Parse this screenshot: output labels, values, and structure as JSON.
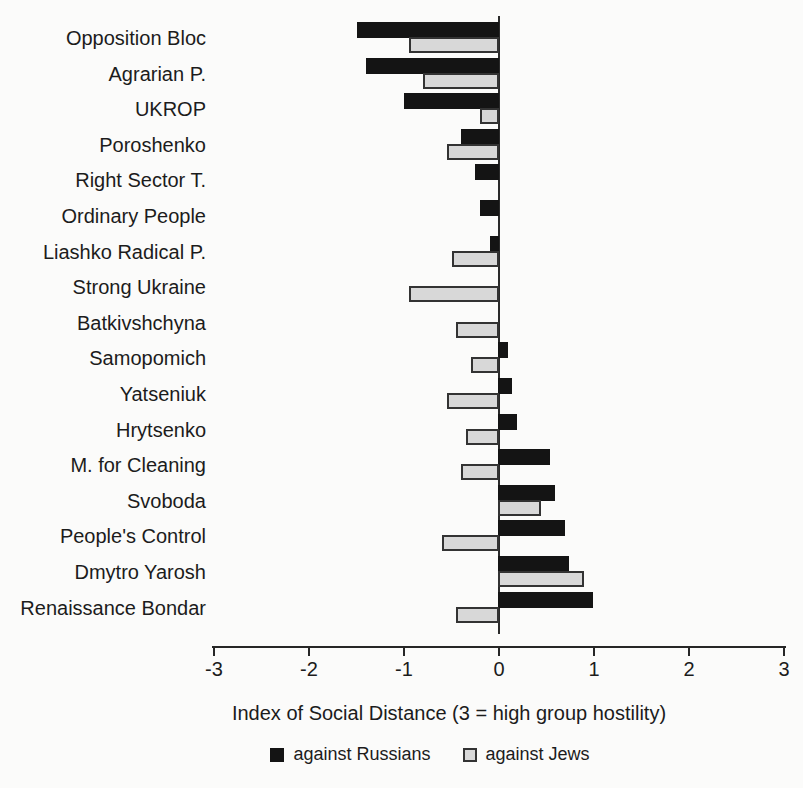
{
  "chart_data": {
    "type": "bar",
    "orientation": "horizontal",
    "title": "",
    "xlabel": "Index of Social Distance (3 = high group hostility)",
    "ylabel": "",
    "xlim": [
      -3,
      3
    ],
    "xticks": [
      -3,
      -2,
      -1,
      0,
      1,
      2,
      3
    ],
    "grid": false,
    "legend_position": "bottom",
    "categories": [
      "Opposition Bloc",
      "Agrarian P.",
      "UKROP",
      "Poroshenko",
      "Right Sector T.",
      "Ordinary People",
      "Liashko Radical P.",
      "Strong Ukraine",
      "Batkivshchyna",
      "Samopomich",
      "Yatseniuk",
      "Hrytsenko",
      "M. for Cleaning",
      "Svoboda",
      "People's Control",
      "Dmytro Yarosh",
      "Renaissance Bondar"
    ],
    "series": [
      {
        "name": "against Russians",
        "color": "#141414",
        "values": [
          -1.5,
          -1.4,
          -1.0,
          -0.4,
          -0.25,
          -0.2,
          -0.1,
          0,
          0,
          0.1,
          0.15,
          0.2,
          0.55,
          0.6,
          0.7,
          0.75,
          1.0
        ]
      },
      {
        "name": "against Jews",
        "color": "#d8d8d8",
        "values": [
          -0.95,
          -0.8,
          -0.2,
          -0.55,
          0,
          0,
          -0.5,
          -0.95,
          -0.45,
          -0.3,
          -0.55,
          -0.35,
          -0.4,
          0.45,
          -0.6,
          0.9,
          -0.45
        ]
      }
    ]
  }
}
